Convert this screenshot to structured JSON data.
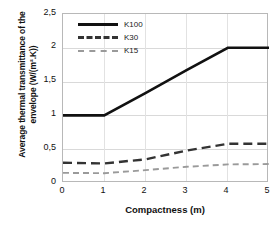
{
  "chart_data": {
    "type": "line",
    "title": "",
    "xlabel": "Compactness (m)",
    "ylabel": "Average thermal transmittance of the envelope (W/(m².K))",
    "ylabel_line1": "Average thermal transmittance of the",
    "ylabel_line2": "envelope (W/(m².K))",
    "x": [
      0,
      1,
      2,
      3,
      4,
      5
    ],
    "xlim": [
      0,
      5
    ],
    "ylim": [
      0,
      2.5
    ],
    "xticks": [
      "0",
      "1",
      "2",
      "3",
      "4",
      "5"
    ],
    "yticks": [
      "0",
      "0,5",
      "1",
      "1,5",
      "2",
      "2,5"
    ],
    "ytick_values": [
      0,
      0.5,
      1,
      1.5,
      2,
      2.5
    ],
    "grid": "horizontal-and-vertical",
    "legend_position": "top-left-inside",
    "series": [
      {
        "name": "K100",
        "values": [
          1.0,
          1.0,
          1.33,
          1.67,
          2.0,
          2.0
        ],
        "style": "solid",
        "color": "#111111",
        "width": 2.6
      },
      {
        "name": "K30",
        "values": [
          0.3,
          0.29,
          0.35,
          0.48,
          0.58,
          0.58
        ],
        "style": "dashed",
        "color": "#333333",
        "width": 2.4
      },
      {
        "name": "K15",
        "values": [
          0.15,
          0.145,
          0.19,
          0.24,
          0.275,
          0.28
        ],
        "style": "dashed",
        "color": "#9a9a9a",
        "width": 1.9
      }
    ]
  },
  "legend": {
    "items": [
      {
        "label": "K100"
      },
      {
        "label": "K30"
      },
      {
        "label": "K15"
      }
    ]
  },
  "axes": {
    "x_title": "Compactness (m)",
    "y_title_line1": "Average thermal transmittance of the",
    "y_title_line2": "envelope (W/(m².K))"
  },
  "colors": {
    "k100": "#111111",
    "k30": "#333333",
    "k15": "#9a9a9a",
    "frame": "#b8b8b8",
    "grid": "#d9d9d9",
    "background": "#ffffff"
  }
}
